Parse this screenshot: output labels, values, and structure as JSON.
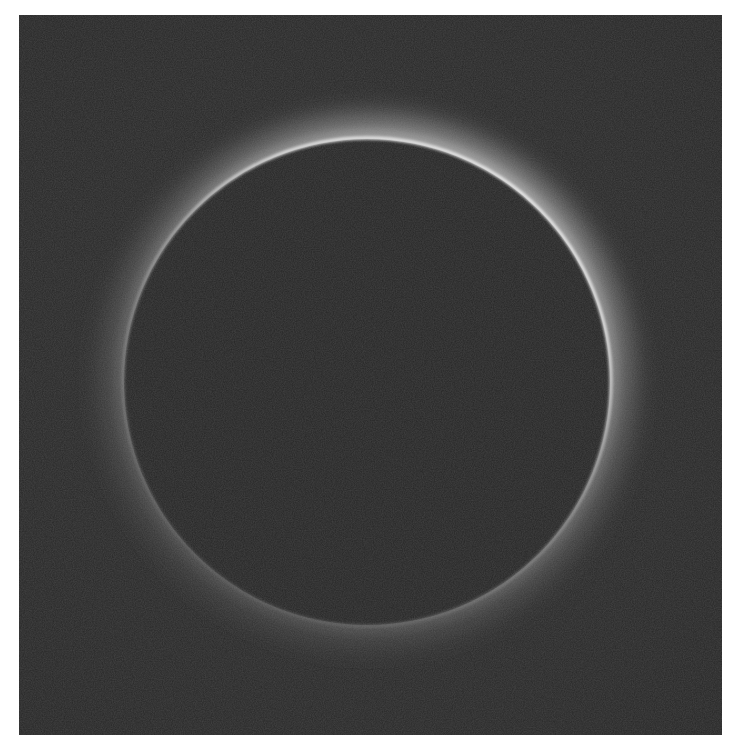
{
  "image": {
    "subject": "Total solar eclipse corona ring",
    "description": "Dark lunar disk surrounded by a thin bright ring of light, brightest along the top and upper-right, fading toward the bottom-left, on a dark grainy background with a white border.",
    "colors": {
      "border": "#ffffff",
      "background": "#2a2a2a",
      "disk": "#262626",
      "ring_bright": "#f2f2f2",
      "ring_glow": "#9a9a9a"
    },
    "geometry": {
      "photo_left": 19,
      "photo_top": 15,
      "photo_width": 703,
      "photo_height": 720,
      "disk_center_x": 367,
      "disk_center_y": 382,
      "disk_radius": 244
    }
  }
}
